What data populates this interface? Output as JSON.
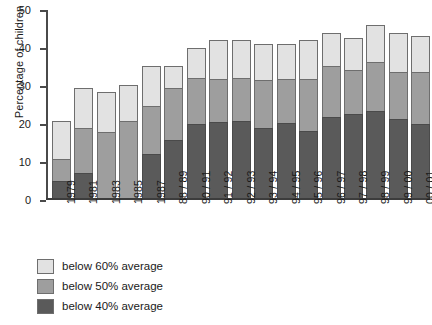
{
  "chart_data": {
    "type": "bar",
    "stacked": true,
    "title": "",
    "xlabel": "",
    "ylabel": "Percentage of children",
    "ylim": [
      0,
      50
    ],
    "yticks": [
      0,
      10,
      20,
      30,
      40,
      50
    ],
    "grid": false,
    "legend_position": "below-left",
    "categories": [
      "1979",
      "1981",
      "1983",
      "1985",
      "1987",
      "88 / 89",
      "90 / 91",
      "91 / 92",
      "92 / 93",
      "93 / 94",
      "94 / 95",
      "95 / 96",
      "96 / 97",
      "97 / 98",
      "98 / 99",
      "99 / 00",
      "00 / 01"
    ],
    "series": [
      {
        "name": "below 40% average",
        "color": "#5a5a5a",
        "values": [
          4.6,
          6.7,
          0.0,
          0.0,
          11.7,
          15.5,
          19.8,
          20.3,
          20.5,
          18.5,
          20.0,
          17.7,
          21.5,
          22.3,
          23.2,
          21.0,
          19.7
        ]
      },
      {
        "name": "below 50% average",
        "color": "#9e9e9e",
        "values": [
          5.7,
          11.8,
          17.5,
          20.5,
          12.7,
          13.8,
          12.2,
          11.3,
          11.5,
          13.0,
          11.7,
          14.0,
          13.5,
          11.7,
          13.0,
          12.5,
          13.8
        ]
      },
      {
        "name": "below 60% average",
        "color": "#e2e2e2",
        "values": [
          10.2,
          10.7,
          10.7,
          9.5,
          10.6,
          5.7,
          8.0,
          10.4,
          10.0,
          9.5,
          9.3,
          10.3,
          9.0,
          8.5,
          9.8,
          10.5,
          9.5
        ]
      }
    ],
    "totals": [
      20.5,
      29.2,
      28.2,
      30.0,
      35.0,
      35.0,
      40.0,
      42.0,
      42.0,
      41.0,
      41.0,
      42.0,
      44.0,
      42.5,
      46.0,
      44.0,
      43.0
    ]
  },
  "legend": {
    "items": [
      {
        "label": "below 60% average",
        "swatch": "sw60"
      },
      {
        "label": "below 50% average",
        "swatch": "sw50"
      },
      {
        "label": "below 40% average",
        "swatch": "sw40"
      }
    ]
  }
}
